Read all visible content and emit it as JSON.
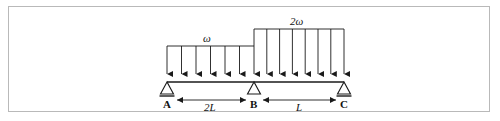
{
  "figure": {
    "type": "structural-beam-diagram",
    "stroke_color": "#1a1a1a",
    "frame_color": "#b9b9b9",
    "background": "#ffffff"
  },
  "loads": [
    {
      "id": "load-w",
      "label": "ω",
      "span": "A-B",
      "magnitude_relative": 1,
      "arrow_count": 7,
      "description": "uniformly distributed load of intensity omega over span AB"
    },
    {
      "id": "load-2w",
      "label": "2ω",
      "span": "B-C",
      "magnitude_relative": 2,
      "arrow_count": 8,
      "description": "uniformly distributed load of intensity two omega over span BC"
    }
  ],
  "supports": [
    {
      "id": "support-a",
      "label": "A",
      "type": "pin",
      "has_base_line": true
    },
    {
      "id": "support-b",
      "label": "B",
      "type": "roller",
      "has_base_line": false
    },
    {
      "id": "support-c",
      "label": "C",
      "type": "pin",
      "has_base_line": true
    }
  ],
  "dimensions": [
    {
      "id": "dim-ab",
      "label": "2L",
      "from": "A",
      "to": "B"
    },
    {
      "id": "dim-bc",
      "label": "L",
      "from": "B",
      "to": "C"
    }
  ],
  "geometry": {
    "beam_y": 82,
    "support_a_x": 167,
    "support_b_x": 254,
    "support_c_x": 344,
    "load_w_top_y": 46,
    "load_2w_top_y": 29,
    "dim_line_y": 94
  }
}
